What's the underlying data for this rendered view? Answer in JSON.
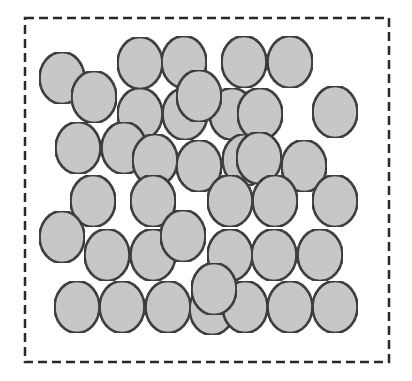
{
  "diagram": {
    "colors": {
      "background": "#ffffff",
      "particle_fill": "#c8c8c8",
      "particle_stroke": "#151515",
      "boundary_stroke": "#2a2a2a"
    },
    "boundary": {
      "x": 25,
      "y": 18,
      "width": 364,
      "height": 344,
      "dash": "9 5",
      "stroke_width": 2.5
    },
    "particle_radius": {
      "rx": 22.5,
      "ry": 26
    },
    "particles": [
      {
        "cx": 62,
        "cy": 78
      },
      {
        "cx": 94,
        "cy": 97
      },
      {
        "cx": 140,
        "cy": 63
      },
      {
        "cx": 184,
        "cy": 62
      },
      {
        "cx": 244,
        "cy": 62
      },
      {
        "cx": 290,
        "cy": 62
      },
      {
        "cx": 335,
        "cy": 112
      },
      {
        "cx": 140,
        "cy": 114
      },
      {
        "cx": 185,
        "cy": 114
      },
      {
        "cx": 232,
        "cy": 114
      },
      {
        "cx": 78,
        "cy": 148
      },
      {
        "cx": 124,
        "cy": 148
      },
      {
        "cx": 155,
        "cy": 160
      },
      {
        "cx": 245,
        "cy": 160
      },
      {
        "cx": 199,
        "cy": 166
      },
      {
        "cx": 304,
        "cy": 166
      },
      {
        "cx": 199,
        "cy": 96
      },
      {
        "cx": 260,
        "cy": 114
      },
      {
        "cx": 259,
        "cy": 158
      },
      {
        "cx": 93,
        "cy": 201
      },
      {
        "cx": 153,
        "cy": 201
      },
      {
        "cx": 230,
        "cy": 201
      },
      {
        "cx": 275,
        "cy": 201
      },
      {
        "cx": 335,
        "cy": 201
      },
      {
        "cx": 62,
        "cy": 237
      },
      {
        "cx": 107,
        "cy": 255
      },
      {
        "cx": 153,
        "cy": 255
      },
      {
        "cx": 230,
        "cy": 255
      },
      {
        "cx": 274,
        "cy": 255
      },
      {
        "cx": 320,
        "cy": 255
      },
      {
        "cx": 183,
        "cy": 236
      },
      {
        "cx": 77,
        "cy": 307
      },
      {
        "cx": 122,
        "cy": 307
      },
      {
        "cx": 168,
        "cy": 307
      },
      {
        "cx": 212,
        "cy": 309
      },
      {
        "cx": 245,
        "cy": 307
      },
      {
        "cx": 290,
        "cy": 307
      },
      {
        "cx": 335,
        "cy": 307
      },
      {
        "cx": 214,
        "cy": 289
      }
    ]
  }
}
